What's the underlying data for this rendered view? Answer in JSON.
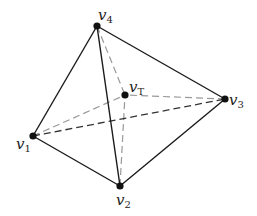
{
  "diagram": {
    "title": "",
    "colors": {
      "solid_edge": "#1a1a1a",
      "hidden_edge": "#333333",
      "interior_edge": "#999999",
      "vertex": "#111111",
      "label": "#222222"
    },
    "vertices": [
      {
        "id": "v1",
        "base": "v",
        "sub": "1",
        "x": 33,
        "y": 136,
        "label_x": 16,
        "label_y": 149
      },
      {
        "id": "v2",
        "base": "v",
        "sub": "2",
        "x": 120,
        "y": 186,
        "label_x": 116,
        "label_y": 205
      },
      {
        "id": "v3",
        "base": "v",
        "sub": "3",
        "x": 225,
        "y": 99,
        "label_x": 229,
        "label_y": 105
      },
      {
        "id": "v4",
        "base": "v",
        "sub": "4",
        "x": 97,
        "y": 26,
        "label_x": 98,
        "label_y": 20
      },
      {
        "id": "vT",
        "base": "v",
        "sub": "T",
        "x": 125,
        "y": 95,
        "label_x": 129,
        "label_y": 92
      }
    ],
    "edges": [
      {
        "from": "v4",
        "to": "v1",
        "style": "solid"
      },
      {
        "from": "v4",
        "to": "v3",
        "style": "solid"
      },
      {
        "from": "v4",
        "to": "v2",
        "style": "solid"
      },
      {
        "from": "v1",
        "to": "v2",
        "style": "solid"
      },
      {
        "from": "v2",
        "to": "v3",
        "style": "solid"
      },
      {
        "from": "v1",
        "to": "v3",
        "style": "hidden"
      },
      {
        "from": "v4",
        "to": "vT",
        "style": "interior"
      },
      {
        "from": "v1",
        "to": "vT",
        "style": "interior"
      },
      {
        "from": "v3",
        "to": "vT",
        "style": "interior"
      },
      {
        "from": "v2",
        "to": "vT",
        "style": "interior"
      }
    ]
  }
}
